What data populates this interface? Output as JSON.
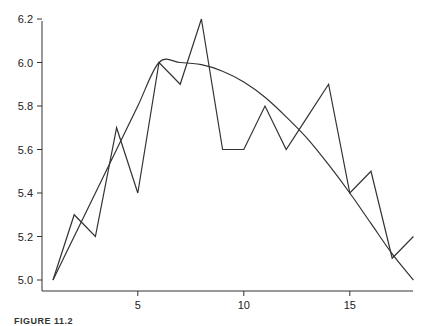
{
  "chart_data": {
    "type": "line",
    "title": "",
    "xlabel": "",
    "ylabel": "",
    "xlim": [
      0.6,
      18
    ],
    "ylim": [
      4.95,
      6.2
    ],
    "grid": false,
    "legend": null,
    "x_ticks": [
      5,
      10,
      15
    ],
    "x_tick_labels": [
      "5",
      "10",
      "15"
    ],
    "y_ticks": [
      5.0,
      5.2,
      5.4,
      5.6,
      5.8,
      6.0,
      6.2
    ],
    "y_tick_labels": [
      "5.0",
      "5.2",
      "5.4",
      "5.6",
      "5.8",
      "6.0",
      "6.2"
    ],
    "x": [
      1,
      2,
      3,
      4,
      5,
      6,
      7,
      8,
      9,
      10,
      11,
      12,
      13,
      14,
      15,
      16,
      17,
      18
    ],
    "series": [
      {
        "name": "observed",
        "style": "polyline",
        "values": [
          5.0,
          5.3,
          5.2,
          5.7,
          5.4,
          6.0,
          5.9,
          6.2,
          5.6,
          5.6,
          5.8,
          5.6,
          5.75,
          5.9,
          5.4,
          5.5,
          5.1,
          5.2
        ]
      },
      {
        "name": "smooth-fit",
        "style": "curve",
        "values": [
          5.0,
          5.2,
          5.4,
          5.6,
          5.8,
          6.0,
          6.0,
          5.99,
          5.96,
          5.91,
          5.84,
          5.75,
          5.65,
          5.53,
          5.4,
          5.26,
          5.12,
          5.0
        ]
      }
    ],
    "caption": "FIGURE 11.2"
  },
  "layout": {
    "plot_left_px": 42,
    "plot_right_px": 413,
    "plot_bottom_px": 291,
    "x_px_per_unit": 21.2,
    "x_origin_value": 1,
    "x_origin_px": 53,
    "y_px_per_unit": 217.5,
    "y_origin_value": 5.0,
    "y_origin_px": 280,
    "y_axis_top_px": 21,
    "line_color": "#333333"
  }
}
